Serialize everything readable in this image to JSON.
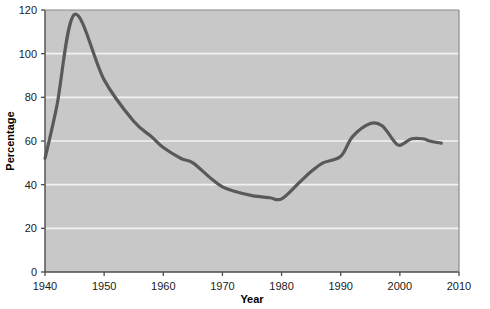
{
  "chart_data": {
    "type": "line",
    "title": "",
    "xlabel": "Year",
    "ylabel": "Percentage",
    "xlim": [
      1940,
      2010
    ],
    "ylim": [
      0,
      120
    ],
    "xticks": [
      1940,
      1950,
      1960,
      1970,
      1980,
      1990,
      2000,
      2010
    ],
    "xtick_labels": [
      "1940",
      "1950",
      "1960",
      "1970",
      "1980",
      "1990",
      "2000",
      "2010"
    ],
    "yticks": [
      0,
      20,
      40,
      60,
      80,
      100,
      120
    ],
    "ytick_labels": [
      "0",
      "20",
      "40",
      "60",
      "80",
      "100",
      "120"
    ],
    "grid": "horizontal",
    "legend": "none",
    "series": [
      {
        "name": "Percentage",
        "color": "#595959",
        "x": [
          1940,
          1942,
          1945,
          1950,
          1955,
          1958,
          1960,
          1963,
          1965,
          1968,
          1970,
          1972,
          1975,
          1978,
          1980,
          1983,
          1985,
          1987,
          1990,
          1992,
          1995,
          1997,
          1999,
          2000,
          2002,
          2004,
          2005,
          2007
        ],
        "y": [
          52,
          76,
          118,
          88,
          69,
          62,
          57,
          52,
          50,
          43,
          39,
          37,
          35,
          34,
          33.5,
          41,
          46,
          50,
          53,
          62,
          68,
          67,
          60,
          58,
          61,
          61,
          60,
          59
        ]
      }
    ],
    "colors": {
      "plot_background": "#c8c8c8",
      "grid_line": "#f2f2f2",
      "axis": "#4d4d4d",
      "line": "#595959",
      "text": "#1a1a1a",
      "page_background": "#ffffff"
    }
  }
}
